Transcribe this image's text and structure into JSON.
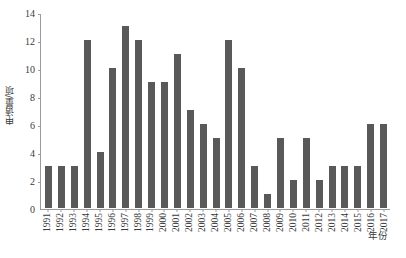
{
  "chart_data": {
    "type": "bar",
    "title": "",
    "subtitle": "",
    "xlabel": "年份",
    "ylabel": "申请量/项",
    "categories": [
      "1991",
      "1992",
      "1993",
      "1994",
      "1995",
      "1996",
      "1997",
      "1998",
      "1999",
      "2000",
      "2001",
      "2002",
      "2003",
      "2004",
      "2005",
      "2006",
      "2007",
      "2008",
      "2009",
      "2010",
      "2011",
      "2012",
      "2013",
      "2014",
      "2015",
      "2016",
      "2017"
    ],
    "values": [
      3,
      3,
      3,
      12,
      4,
      10,
      13,
      12,
      9,
      9,
      11,
      7,
      6,
      5,
      12,
      10,
      3,
      1,
      5,
      2,
      5,
      2,
      3,
      3,
      3,
      6,
      6
    ],
    "ylim": [
      0,
      14
    ],
    "ytick_labels": [
      "0",
      "2",
      "4",
      "6",
      "8",
      "10",
      "12",
      "14"
    ],
    "ytick_values": [
      0,
      2,
      4,
      6,
      8,
      10,
      12,
      14
    ],
    "grid": false,
    "legend": null,
    "bar_color": "#595959",
    "axis_color": "#9a9a9a",
    "background_color": "#ffffff"
  }
}
